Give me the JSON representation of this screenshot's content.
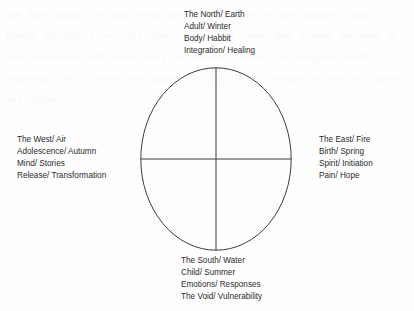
{
  "diagram": {
    "type": "four-quadrant-circle",
    "stroke_color": "#3a3a3a",
    "background_color": "#fefefe",
    "text_color": "#2b2b2b",
    "quadrant_labels": {
      "north": {
        "direction": "north",
        "lines": [
          "The North/ Earth",
          "Adult/ Winter",
          "Body/ Habbit",
          "Integration/ Healing"
        ]
      },
      "west": {
        "direction": "west",
        "lines": [
          "The West/ Air",
          "Adolescence/ Autumn",
          "Mind/ Stories",
          "Release/ Transformation"
        ]
      },
      "east": {
        "direction": "east",
        "lines": [
          "The East/ Fire",
          "Birth/ Spring",
          "Spirit/ Initiation",
          "Pain/ Hope"
        ]
      },
      "south": {
        "direction": "south",
        "lines": [
          "The South/ Water",
          "Child/ Summer",
          "Emotions/ Responses",
          "The Void/ Vulnerability"
        ]
      }
    }
  },
  "background_artifact": {
    "text": "the faint ghost of text from the reverse side of the scanned page bleeds through across the sheet in uneven lines that cannot be read at this resolution and serve only as texture behind the diagram itself repeating softly down the page until the lower margin is reached again and again"
  }
}
